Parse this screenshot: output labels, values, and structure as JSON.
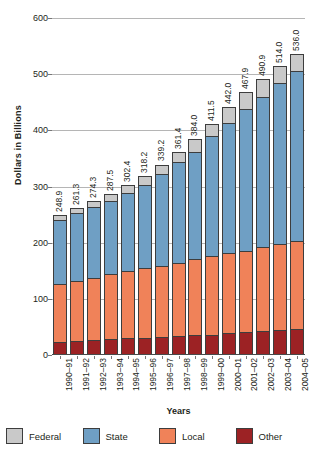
{
  "chart_data": {
    "type": "bar",
    "subtype": "stacked-bar",
    "title": "",
    "xlabel": "Years",
    "ylabel": "Dollars in Billions",
    "ylim": [
      0,
      600
    ],
    "yticks": [
      0,
      100,
      200,
      300,
      400,
      500,
      600
    ],
    "grid": true,
    "legend_position": "bottom",
    "categories": [
      "1990–91",
      "1991–92",
      "1992–93",
      "1993–94",
      "1994–95",
      "1995–96",
      "1996–97",
      "1997–98",
      "1998–99",
      "1999–00",
      "2000–01",
      "2001–02",
      "2002–03",
      "2003–04",
      "2004–05"
    ],
    "totals": [
      248.9,
      261.3,
      274.3,
      287.5,
      302.4,
      318.2,
      339.2,
      361.4,
      384.0,
      411.5,
      442.0,
      467.9,
      490.9,
      514.0,
      536.0
    ],
    "total_labels": [
      "248.9",
      "261.3",
      "274.3",
      "287.5",
      "302.4",
      "318.2",
      "339.2",
      "361.4",
      "384.0",
      "411.5",
      "442.0",
      "467.9",
      "490.9",
      "514.0",
      "536.0"
    ],
    "series": [
      {
        "name": "Other",
        "color": "#9c2224",
        "values": [
          24.0,
          25.5,
          26.5,
          28.0,
          29.5,
          30.5,
          32.0,
          33.5,
          35.0,
          36.5,
          38.5,
          40.5,
          42.5,
          44.0,
          45.5
        ]
      },
      {
        "name": "Local",
        "color": "#f08259",
        "values": [
          103.0,
          106.0,
          110.0,
          115.5,
          120.0,
          124.5,
          126.5,
          131.0,
          136.0,
          140.0,
          143.0,
          145.5,
          149.5,
          154.5,
          158.0
        ]
      },
      {
        "name": "State",
        "color": "#6f9fc4",
        "values": [
          113.0,
          120.5,
          126.5,
          130.0,
          139.0,
          148.0,
          163.5,
          178.5,
          190.0,
          213.0,
          232.5,
          252.0,
          268.0,
          286.5,
          303.0
        ]
      },
      {
        "name": "Federal",
        "color": "#c9c9c9",
        "values": [
          8.9,
          9.3,
          11.3,
          14.0,
          13.9,
          15.2,
          17.2,
          18.4,
          23.0,
          22.0,
          28.0,
          29.9,
          30.9,
          29.0,
          29.5
        ]
      }
    ]
  },
  "legend": {
    "items": [
      {
        "label": "Federal",
        "color": "#c9c9c9"
      },
      {
        "label": "State",
        "color": "#6f9fc4"
      },
      {
        "label": "Local",
        "color": "#f08259"
      },
      {
        "label": "Other",
        "color": "#9c2224"
      }
    ]
  }
}
